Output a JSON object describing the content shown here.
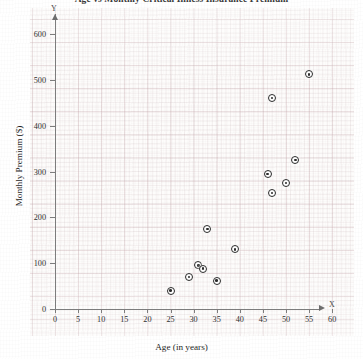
{
  "chart_data": {
    "type": "scatter",
    "title": "Age vs Monthly Critical Illness Insurance Premium",
    "xlabel": "Age (in years)",
    "ylabel": "Monthly Premium ($)",
    "x_axis_letter": "X",
    "y_axis_letter": "Y",
    "xlim": [
      0,
      62
    ],
    "ylim": [
      0,
      620
    ],
    "xticks": [
      0,
      5,
      10,
      15,
      20,
      25,
      30,
      35,
      40,
      45,
      50,
      55,
      60
    ],
    "yticks": [
      0,
      100,
      200,
      300,
      400,
      500,
      600
    ],
    "xtick_labels": [
      "0",
      "5",
      "10",
      "15",
      "20",
      "25",
      "30",
      "35",
      "40",
      "45",
      "50",
      "55",
      "60"
    ],
    "ytick_labels": [
      "0",
      "100",
      "200",
      "300",
      "400",
      "500",
      "600"
    ],
    "grid": true,
    "grid_style": "graph-paper",
    "legend": null,
    "marker_style": "bullseye-circle",
    "points": [
      {
        "x": 25,
        "y": 40
      },
      {
        "x": 29,
        "y": 70
      },
      {
        "x": 31,
        "y": 95
      },
      {
        "x": 32,
        "y": 88
      },
      {
        "x": 33,
        "y": 175
      },
      {
        "x": 35,
        "y": 62
      },
      {
        "x": 39,
        "y": 130
      },
      {
        "x": 46,
        "y": 295
      },
      {
        "x": 47,
        "y": 460
      },
      {
        "x": 47,
        "y": 253
      },
      {
        "x": 50,
        "y": 275
      },
      {
        "x": 52,
        "y": 325
      },
      {
        "x": 55,
        "y": 512
      }
    ]
  },
  "colors": {
    "marker": "#2b2b2b",
    "axis": "#7d7d7d",
    "grid_major": "#be9ba0",
    "grid_minor": "#c8afb2",
    "paper": "#fdfcfb",
    "text": "#1f1f1f"
  }
}
